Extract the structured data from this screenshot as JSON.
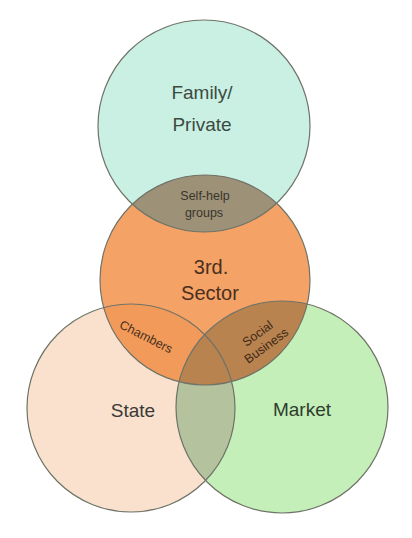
{
  "diagram": {
    "type": "venn",
    "sets": [
      {
        "id": "family",
        "lines": [
          "Family/",
          "Private"
        ],
        "color": "#c9f0e3",
        "text_color": "#3c4a42"
      },
      {
        "id": "third",
        "lines": [
          "3rd.",
          "Sector"
        ],
        "color": "#f4a265",
        "text_color": "#4a3020"
      },
      {
        "id": "state",
        "lines": [
          "State"
        ],
        "color": "#f9e1cd",
        "text_color": "#3a3a38"
      },
      {
        "id": "market",
        "lines": [
          "Market"
        ],
        "color": "#c4efb8",
        "text_color": "#2f3d2e"
      }
    ],
    "intersections": [
      {
        "id": "self-help",
        "sets": [
          "family",
          "third"
        ],
        "lines": [
          "Self-help",
          "groups"
        ],
        "color": "#9d9178",
        "text_color": "#3a352c"
      },
      {
        "id": "chambers",
        "sets": [
          "third",
          "state"
        ],
        "lines": [
          "Chambers"
        ],
        "color": "#f29a5a",
        "text_color": "#4a3020"
      },
      {
        "id": "social-business",
        "sets": [
          "third",
          "market"
        ],
        "lines": [
          "Social",
          "Business"
        ],
        "color": "#b98350",
        "text_color": "#3f2a18"
      },
      {
        "id": "state-market",
        "sets": [
          "state",
          "market"
        ],
        "lines": [],
        "color": "#b4c29e",
        "text_color": "#333333"
      }
    ]
  }
}
